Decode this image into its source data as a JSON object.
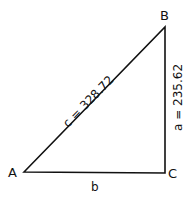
{
  "diagram": {
    "type": "right-triangle",
    "vertices": {
      "A": {
        "label": "A",
        "x": 24,
        "y": 172
      },
      "B": {
        "label": "B",
        "x": 165,
        "y": 27
      },
      "C": {
        "label": "C",
        "x": 165,
        "y": 173
      }
    },
    "sides": {
      "c": {
        "label": "c = 328.72",
        "from": "A",
        "to": "B"
      },
      "a": {
        "label": "a = 235.62",
        "from": "B",
        "to": "C"
      },
      "b": {
        "label": "b",
        "from": "A",
        "to": "C"
      }
    },
    "stroke_color": "#111111"
  }
}
